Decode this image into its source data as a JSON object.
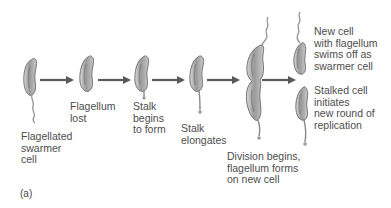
{
  "figure": {
    "panel_label": "(a)",
    "colors": {
      "cell_fill": "#b9b9b9",
      "cell_outline": "#6b6b6b",
      "cell_interior": "#7d7d7d",
      "arrow": "#5a5a5a",
      "text": "#4d4d4d",
      "background": "#ffffff"
    },
    "stages": [
      {
        "id": "stage1",
        "label_lines": [
          "Flagellated",
          "swarmer",
          "cell"
        ]
      },
      {
        "id": "stage2",
        "label_lines": [
          "Flagellum",
          "lost"
        ]
      },
      {
        "id": "stage3",
        "label_lines": [
          "Stalk",
          "begins",
          "to form"
        ]
      },
      {
        "id": "stage4",
        "label_lines": [
          "Stalk",
          "elongates"
        ]
      },
      {
        "id": "stage5",
        "label_lines": [
          "Division begins,",
          "flagellum forms",
          "on new cell"
        ]
      },
      {
        "id": "stage6a",
        "label_lines": [
          "New cell",
          "with flagellum",
          "swims off as",
          "swarmer cell"
        ]
      },
      {
        "id": "stage6b",
        "label_lines": [
          "Stalked cell",
          "initiates",
          "new round of",
          "replication"
        ]
      }
    ],
    "arrows": [
      {
        "from": "stage1",
        "to": "stage2"
      },
      {
        "from": "stage2",
        "to": "stage3"
      },
      {
        "from": "stage3",
        "to": "stage4"
      },
      {
        "from": "stage4",
        "to": "stage5"
      },
      {
        "from": "stage5",
        "to": "stage6"
      }
    ]
  }
}
